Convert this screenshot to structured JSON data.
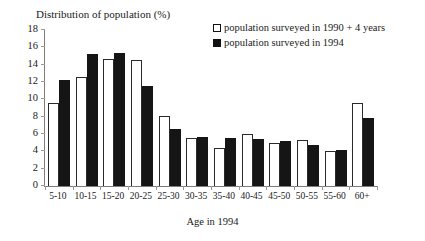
{
  "chart_data": {
    "type": "bar",
    "title": "Distribution of population (%)",
    "xlabel": "Age in 1994",
    "ylabel": "Distribution of population (%)",
    "ylim": [
      0,
      18
    ],
    "ytick_step": 2,
    "yticks": [
      "18",
      "16",
      "14",
      "12",
      "10",
      "8",
      "6",
      "4",
      "2",
      "0"
    ],
    "grid": false,
    "legend_position": "top-right",
    "categories": [
      "5-10",
      "10-15",
      "15-20",
      "20-25",
      "25-30",
      "30-35",
      "35-40",
      "40-45",
      "45-50",
      "50-55",
      "55-60",
      "60+"
    ],
    "series": [
      {
        "name": "population surveyed in 1990 + 4 years",
        "style": "hollow",
        "values": [
          9.6,
          12.6,
          14.7,
          14.5,
          8.1,
          5.5,
          4.4,
          6.0,
          5.0,
          5.3,
          4.0,
          9.6
        ]
      },
      {
        "name": "population surveyed in 1994",
        "style": "filled",
        "values": [
          12.2,
          15.2,
          15.3,
          11.5,
          6.6,
          5.7,
          5.5,
          5.4,
          5.2,
          4.7,
          4.2,
          7.8
        ]
      }
    ]
  },
  "colors": {
    "filled_series": "#151515",
    "hollow_series_border": "#2a2a2a",
    "axis": "#7d7d7d",
    "background": "#ffffff",
    "text": "#1a1a1a"
  }
}
